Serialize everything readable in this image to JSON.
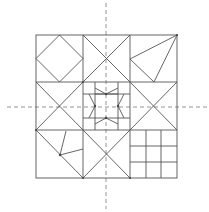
{
  "diagram": {
    "type": "quilt-block-symmetry",
    "grid": {
      "rows": 3,
      "cols": 3
    },
    "colors": {
      "stroke": "#555555",
      "dashed": "#888888",
      "background": "#ffffff"
    },
    "axes": [
      {
        "orientation": "vertical",
        "style": "dashed"
      },
      {
        "orientation": "horizontal",
        "style": "dashed"
      }
    ],
    "cells": [
      {
        "row": 0,
        "col": 0,
        "pattern": "inscribed-diamond"
      },
      {
        "row": 0,
        "col": 1,
        "pattern": "x-cross"
      },
      {
        "row": 0,
        "col": 2,
        "pattern": "kite-triangle"
      },
      {
        "row": 1,
        "col": 0,
        "pattern": "x-cross"
      },
      {
        "row": 1,
        "col": 1,
        "pattern": "star-grid"
      },
      {
        "row": 1,
        "col": 2,
        "pattern": "x-cross"
      },
      {
        "row": 2,
        "col": 0,
        "pattern": "diagonal-with-bent-lines"
      },
      {
        "row": 2,
        "col": 1,
        "pattern": "x-cross"
      },
      {
        "row": 2,
        "col": 2,
        "pattern": "3x3-grid"
      }
    ]
  }
}
